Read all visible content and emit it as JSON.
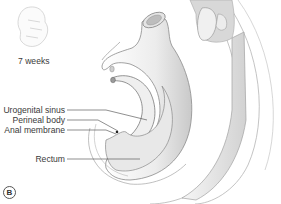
{
  "thumbnail": {
    "age_label": "7 weeks"
  },
  "labels": [
    {
      "id": "urogenital-sinus",
      "text": "Urogenital sinus"
    },
    {
      "id": "perineal-body",
      "text": "Perineal body"
    },
    {
      "id": "anal-membrane",
      "text": "Anal membrane"
    },
    {
      "id": "rectum",
      "text": "Rectum"
    }
  ],
  "panel_letter": "B",
  "colors": {
    "outline": "#8a8a8a",
    "fill_light": "#f4f4f4",
    "fill_shade": "#d6d6d6",
    "leader": "#444444"
  }
}
